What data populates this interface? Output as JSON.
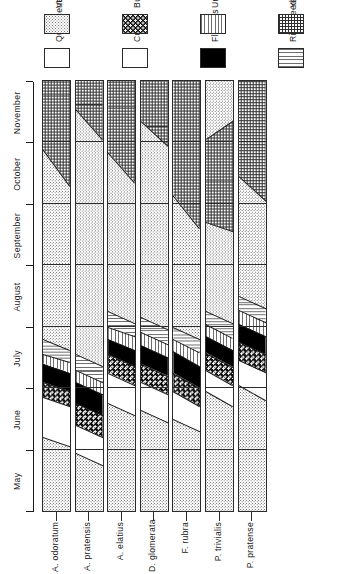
{
  "figure": {
    "type": "phenology-chart",
    "orientation": "rotated-90ccw"
  },
  "axis": {
    "label": "",
    "months": [
      "May",
      "June",
      "July",
      "August",
      "September",
      "October",
      "November"
    ]
  },
  "legend": {
    "items": [
      {
        "key": "quiescent",
        "label": "Quiescent",
        "pattern": "white",
        "color": "#ffffff"
      },
      {
        "key": "veg",
        "label": "Vegetative growth",
        "pattern": "stipple-medium",
        "color": "#7d7d7d"
      },
      {
        "key": "culms",
        "label": "Culms",
        "pattern": "stipple-light",
        "color": "#a9a9a9"
      },
      {
        "key": "buds",
        "label": "Buds",
        "pattern": "dark-checker",
        "color": "#111111"
      },
      {
        "key": "flowers",
        "label": "Flowers",
        "pattern": "solid-black",
        "color": "#000000"
      },
      {
        "key": "unripe",
        "label": "Unripe seeds",
        "pattern": "horizontal-lines",
        "color": "#6e6e6e"
      },
      {
        "key": "ripe",
        "label": "Ripe seeds",
        "pattern": "vertical-lines",
        "color": "#6e6e6e"
      },
      {
        "key": "yellow",
        "label": "Yellowing of leaves",
        "pattern": "crosshatch-grid",
        "color": "#2f2f2f"
      }
    ]
  },
  "chart_data": {
    "type": "area",
    "title": "",
    "xlabel": "",
    "ylabel": "",
    "x": [
      "May",
      "June",
      "July",
      "August",
      "September",
      "October",
      "November"
    ],
    "xlim": [
      0,
      7
    ],
    "grid": true,
    "legend_position": "right",
    "phase_order": [
      "quiescent",
      "veg",
      "culms",
      "buds",
      "flowers",
      "unripe",
      "ripe",
      "yellow"
    ],
    "series": [
      {
        "name": "A. odoratum",
        "bands": [
          {
            "phase": "veg",
            "start": 0.0,
            "end": 1.05,
            "top_start": 0.0,
            "top_end": 1.2
          },
          {
            "phase": "culms",
            "start": 1.05,
            "end": 1.7,
            "top_start": 1.2,
            "top_end": 1.85
          },
          {
            "phase": "buds",
            "start": 1.7,
            "end": 1.95,
            "top_start": 1.85,
            "top_end": 2.1
          },
          {
            "phase": "flowers",
            "start": 1.95,
            "end": 2.25,
            "top_start": 2.1,
            "top_end": 2.4
          },
          {
            "phase": "unripe",
            "start": 2.25,
            "end": 2.42,
            "top_start": 2.4,
            "top_end": 2.55
          },
          {
            "phase": "ripe",
            "start": 2.42,
            "end": 2.62,
            "top_start": 2.55,
            "top_end": 2.8
          },
          {
            "phase": "veg",
            "start": 2.62,
            "end": 5.3,
            "top_start": 2.8,
            "top_end": 5.9
          },
          {
            "phase": "yellow",
            "start": 5.3,
            "end": 7.0,
            "top_start": 5.9,
            "top_end": 7.0
          }
        ]
      },
      {
        "name": "A. pratensis",
        "bands": [
          {
            "phase": "veg",
            "start": 0.0,
            "end": 0.75,
            "top_start": 0.0,
            "top_end": 0.95
          },
          {
            "phase": "culms",
            "start": 0.75,
            "end": 1.2,
            "top_start": 0.95,
            "top_end": 1.4
          },
          {
            "phase": "buds",
            "start": 1.2,
            "end": 1.55,
            "top_start": 1.4,
            "top_end": 1.75
          },
          {
            "phase": "flowers",
            "start": 1.55,
            "end": 1.9,
            "top_start": 1.75,
            "top_end": 2.1
          },
          {
            "phase": "unripe",
            "start": 1.9,
            "end": 2.1,
            "top_start": 2.1,
            "top_end": 2.3
          },
          {
            "phase": "ripe",
            "start": 2.1,
            "end": 2.35,
            "top_start": 2.3,
            "top_end": 2.55
          },
          {
            "phase": "veg",
            "start": 2.35,
            "end": 6.05,
            "top_start": 2.55,
            "top_end": 6.55
          },
          {
            "phase": "yellow",
            "start": 6.05,
            "end": 7.0,
            "top_start": 6.55,
            "top_end": 7.0
          }
        ]
      },
      {
        "name": "A. elatius",
        "bands": [
          {
            "phase": "veg",
            "start": 0.0,
            "end": 1.55,
            "top_start": 0.0,
            "top_end": 1.75
          },
          {
            "phase": "culms",
            "start": 1.55,
            "end": 2.05,
            "top_start": 1.75,
            "top_end": 2.25
          },
          {
            "phase": "buds",
            "start": 2.05,
            "end": 2.35,
            "top_start": 2.25,
            "top_end": 2.55
          },
          {
            "phase": "flowers",
            "start": 2.35,
            "end": 2.62,
            "top_start": 2.55,
            "top_end": 2.8
          },
          {
            "phase": "unripe",
            "start": 2.62,
            "end": 2.85,
            "top_start": 2.8,
            "top_end": 3.0
          },
          {
            "phase": "ripe",
            "start": 2.85,
            "end": 3.05,
            "top_start": 3.0,
            "top_end": 3.25
          },
          {
            "phase": "veg",
            "start": 3.05,
            "end": 5.35,
            "top_start": 3.25,
            "top_end": 5.85
          },
          {
            "phase": "yellow",
            "start": 5.35,
            "end": 7.0,
            "top_start": 5.85,
            "top_end": 7.0
          }
        ]
      },
      {
        "name": "D. glomerata",
        "bands": [
          {
            "phase": "veg",
            "start": 0.0,
            "end": 1.45,
            "top_start": 0.0,
            "top_end": 1.65
          },
          {
            "phase": "culms",
            "start": 1.45,
            "end": 1.9,
            "top_start": 1.65,
            "top_end": 2.1
          },
          {
            "phase": "buds",
            "start": 1.9,
            "end": 2.2,
            "top_start": 2.1,
            "top_end": 2.4
          },
          {
            "phase": "flowers",
            "start": 2.2,
            "end": 2.5,
            "top_start": 2.4,
            "top_end": 2.7
          },
          {
            "phase": "unripe",
            "start": 2.5,
            "end": 2.72,
            "top_start": 2.7,
            "top_end": 2.92
          },
          {
            "phase": "ripe",
            "start": 2.72,
            "end": 2.95,
            "top_start": 2.92,
            "top_end": 3.15
          },
          {
            "phase": "veg",
            "start": 2.95,
            "end": 5.95,
            "top_start": 3.15,
            "top_end": 6.35
          },
          {
            "phase": "yellow",
            "start": 5.95,
            "end": 7.0,
            "top_start": 6.35,
            "top_end": 7.0
          }
        ]
      },
      {
        "name": "F. rubra",
        "bands": [
          {
            "phase": "veg",
            "start": 0.0,
            "end": 1.3,
            "top_start": 0.0,
            "top_end": 1.5
          },
          {
            "phase": "culms",
            "start": 1.3,
            "end": 1.7,
            "top_start": 1.5,
            "top_end": 1.95
          },
          {
            "phase": "buds",
            "start": 1.7,
            "end": 2.0,
            "top_start": 1.95,
            "top_end": 2.25
          },
          {
            "phase": "flowers",
            "start": 2.0,
            "end": 2.35,
            "top_start": 2.25,
            "top_end": 2.6
          },
          {
            "phase": "unripe",
            "start": 2.35,
            "end": 2.58,
            "top_start": 2.6,
            "top_end": 2.8
          },
          {
            "phase": "ripe",
            "start": 2.58,
            "end": 2.8,
            "top_start": 2.8,
            "top_end": 3.0
          },
          {
            "phase": "veg",
            "start": 2.8,
            "end": 4.6,
            "top_start": 3.0,
            "top_end": 5.15
          },
          {
            "phase": "yellow",
            "start": 4.6,
            "end": 7.0,
            "top_start": 5.15,
            "top_end": 7.0
          }
        ]
      },
      {
        "name": "P. trivialis",
        "bands": [
          {
            "phase": "veg",
            "start": 0.0,
            "end": 1.7,
            "top_start": 0.0,
            "top_end": 1.95
          },
          {
            "phase": "culms",
            "start": 1.7,
            "end": 2.05,
            "top_start": 1.95,
            "top_end": 2.3
          },
          {
            "phase": "buds",
            "start": 2.05,
            "end": 2.35,
            "top_start": 2.3,
            "top_end": 2.58
          },
          {
            "phase": "flowers",
            "start": 2.35,
            "end": 2.62,
            "top_start": 2.58,
            "top_end": 2.85
          },
          {
            "phase": "unripe",
            "start": 2.62,
            "end": 2.82,
            "top_start": 2.85,
            "top_end": 3.05
          },
          {
            "phase": "ripe",
            "start": 2.82,
            "end": 3.05,
            "top_start": 3.05,
            "top_end": 3.25
          },
          {
            "phase": "veg",
            "start": 3.05,
            "end": 4.55,
            "top_start": 3.25,
            "top_end": 4.7
          },
          {
            "phase": "yellow",
            "start": 4.55,
            "end": 6.35,
            "top_start": 4.7,
            "top_end": 6.05
          },
          {
            "phase": "veg",
            "start": 6.35,
            "end": 7.0,
            "top_start": 6.05,
            "top_end": 7.0
          }
        ]
      },
      {
        "name": "P. pratense",
        "bands": [
          {
            "phase": "veg",
            "start": 0.0,
            "end": 1.8,
            "top_start": 0.0,
            "top_end": 2.05
          },
          {
            "phase": "culms",
            "start": 1.8,
            "end": 2.25,
            "top_start": 2.05,
            "top_end": 2.45
          },
          {
            "phase": "buds",
            "start": 2.25,
            "end": 2.55,
            "top_start": 2.45,
            "top_end": 2.75
          },
          {
            "phase": "flowers",
            "start": 2.55,
            "end": 2.85,
            "top_start": 2.75,
            "top_end": 3.05
          },
          {
            "phase": "unripe",
            "start": 2.85,
            "end": 3.08,
            "top_start": 3.05,
            "top_end": 3.28
          },
          {
            "phase": "ripe",
            "start": 3.08,
            "end": 3.3,
            "top_start": 3.28,
            "top_end": 3.5
          },
          {
            "phase": "veg",
            "start": 3.3,
            "end": 5.05,
            "top_start": 3.5,
            "top_end": 5.45
          },
          {
            "phase": "yellow",
            "start": 5.05,
            "end": 7.0,
            "top_start": 5.45,
            "top_end": 7.0
          }
        ]
      }
    ]
  }
}
